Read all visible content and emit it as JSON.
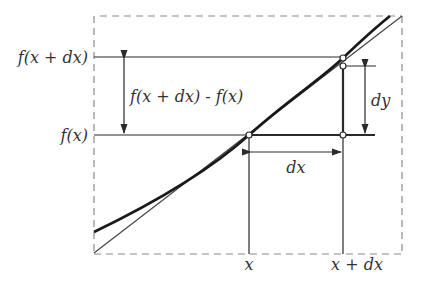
{
  "diagram": {
    "labels": {
      "f_x_plus_dx": "f(x + dx)",
      "f_x": "f(x)",
      "difference": "f(x + dx) - f(x)",
      "dy": "dy",
      "dx": "dx",
      "x": "x",
      "x_plus_dx": "x + dx"
    },
    "colors": {
      "line": "#2a2a2a",
      "dashed_frame": "#8a8a8a",
      "text": "#333333",
      "background": "#ffffff"
    },
    "elements": {
      "curve": "function curve y = f(x)",
      "tangent": "tangent line at x",
      "points": [
        "(x, f(x))",
        "(x+dx, f(x+dx))",
        "(x+dx, f(x)+dy)",
        "(x+dx, f(x))"
      ]
    }
  }
}
